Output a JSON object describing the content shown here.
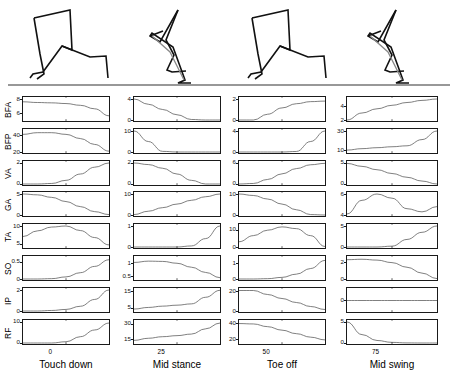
{
  "figure": {
    "title": "",
    "row_labels": [
      "BFA",
      "BFP",
      "VA",
      "GA",
      "TA",
      "SO",
      "IP",
      "RF"
    ],
    "column_labels": [
      "Touch down",
      "Mid stance",
      "Toe off",
      "Mid swing"
    ],
    "x_tick_labels": [
      "0",
      "25",
      "50",
      "75"
    ],
    "axis_color": "#1a1a1a",
    "curve_color": "#555555",
    "ground_color": "#333333"
  },
  "chart_data": {
    "type": "line",
    "xlabel": "Gait cycle (%)",
    "ylabel": "Muscle excitation",
    "grid": false,
    "legend": "none",
    "columns": [
      {
        "name": "Touch down",
        "x_tick": "0",
        "xlim": [
          0,
          25
        ]
      },
      {
        "name": "Mid stance",
        "x_tick": "25",
        "xlim": [
          25,
          50
        ]
      },
      {
        "name": "Toe off",
        "x_tick": "50",
        "xlim": [
          50,
          75
        ]
      },
      {
        "name": "Mid swing",
        "x_tick": "75",
        "xlim": [
          75,
          100
        ]
      }
    ],
    "rows": [
      {
        "name": "BFA",
        "cells": [
          {
            "column": "Touch down",
            "ylim": [
              5,
              8
            ],
            "yticks": [
              6,
              8
            ],
            "values": [
              7.6,
              7.5,
              7.45,
              7.35,
              7.1,
              6.6,
              5.6
            ]
          },
          {
            "column": "Mid stance",
            "ylim": [
              0,
              4
            ],
            "yticks": [
              0,
              4
            ],
            "values": [
              4.0,
              3.0,
              2.0,
              1.0,
              0.1,
              0.0,
              0.0
            ]
          },
          {
            "column": "Toe off",
            "ylim": [
              0,
              2
            ],
            "yticks": [
              0,
              2
            ],
            "values": [
              0.0,
              0.0,
              0.55,
              1.15,
              1.55,
              1.75,
              1.8
            ]
          },
          {
            "column": "Mid swing",
            "ylim": [
              2,
              5
            ],
            "yticks": [
              2,
              4
            ],
            "values": [
              2.0,
              3.0,
              3.6,
              4.1,
              4.5,
              4.8,
              5.0
            ]
          }
        ]
      },
      {
        "name": "BFP",
        "cells": [
          {
            "column": "Touch down",
            "ylim": [
              20,
              45
            ],
            "yticks": [
              20,
              40
            ],
            "values": [
              41,
              43,
              43,
              41,
              36,
              29,
              21
            ]
          },
          {
            "column": "Mid stance",
            "ylim": [
              0,
              10
            ],
            "yticks": [
              0,
              10
            ],
            "values": [
              10,
              5,
              0.3,
              0,
              0,
              0,
              0
            ]
          },
          {
            "column": "Toe off",
            "ylim": [
              0,
              4
            ],
            "yticks": [
              0,
              4
            ],
            "values": [
              0,
              0,
              0,
              0,
              0.1,
              2.0,
              4.0
            ]
          },
          {
            "column": "Mid swing",
            "ylim": [
              8,
              30
            ],
            "yticks": [
              10,
              30
            ],
            "values": [
              10,
              11.5,
              12.5,
              13.5,
              14.5,
              21,
              30
            ]
          }
        ]
      },
      {
        "name": "VA",
        "cells": [
          {
            "column": "Touch down",
            "ylim": [
              0,
              2
            ],
            "yticks": [
              0,
              2
            ],
            "values": [
              0,
              0,
              0.05,
              0.35,
              0.95,
              1.6,
              2.0
            ]
          },
          {
            "column": "Mid stance",
            "ylim": [
              0,
              2
            ],
            "yticks": [
              0,
              2
            ],
            "values": [
              2.0,
              1.85,
              1.5,
              0.95,
              0.35,
              0.0,
              0.0
            ]
          },
          {
            "column": "Toe off",
            "ylim": [
              0,
              6
            ],
            "yticks": [
              0,
              6
            ],
            "values": [
              0,
              0.15,
              1.3,
              2.9,
              4.4,
              5.5,
              5.9
            ]
          },
          {
            "column": "Mid swing",
            "ylim": [
              0,
              5
            ],
            "yticks": [
              0,
              5
            ],
            "values": [
              4.9,
              4.2,
              3.4,
              2.5,
              1.6,
              0.7,
              0.0
            ]
          }
        ]
      },
      {
        "name": "GA",
        "cells": [
          {
            "column": "Touch down",
            "ylim": [
              0,
              5
            ],
            "yticks": [
              0,
              5
            ],
            "values": [
              5.0,
              4.8,
              4.2,
              3.2,
              2.0,
              0.8,
              0.1
            ]
          },
          {
            "column": "Mid stance",
            "ylim": [
              0,
              10
            ],
            "yticks": [
              0,
              10
            ],
            "values": [
              0.2,
              1.8,
              3.5,
              5.2,
              7.0,
              8.7,
              10.0
            ]
          },
          {
            "column": "Toe off",
            "ylim": [
              0,
              10
            ],
            "yticks": [
              0,
              10
            ],
            "values": [
              10,
              9.3,
              7.6,
              5.2,
              2.5,
              0.2,
              0.0
            ]
          },
          {
            "column": "Mid swing",
            "ylim": [
              4,
              6
            ],
            "yticks": [
              4,
              6
            ],
            "values": [
              4.1,
              5.4,
              6.0,
              5.6,
              4.6,
              4.3,
              4.8
            ]
          }
        ]
      },
      {
        "name": "TA",
        "cells": [
          {
            "column": "Touch down",
            "ylim": [
              4,
              10
            ],
            "yticks": [
              5,
              10
            ],
            "values": [
              7.0,
              8.6,
              9.7,
              10.0,
              8.7,
              6.7,
              4.6
            ]
          },
          {
            "column": "Mid stance",
            "ylim": [
              0,
              1
            ],
            "yticks": [
              0,
              1
            ],
            "values": [
              0,
              0,
              0,
              0,
              0.05,
              0.4,
              1.0
            ]
          },
          {
            "column": "Toe off",
            "ylim": [
              0,
              12
            ],
            "yticks": [
              0,
              10
            ],
            "values": [
              3.0,
              6.5,
              9.6,
              11.5,
              10.5,
              6.5,
              0.3
            ]
          },
          {
            "column": "Mid swing",
            "ylim": [
              0,
              5
            ],
            "yticks": [
              0,
              5
            ],
            "values": [
              0,
              0,
              0,
              0.2,
              1.8,
              3.5,
              5.0
            ]
          }
        ]
      },
      {
        "name": "SO",
        "cells": [
          {
            "column": "Touch down",
            "ylim": [
              0,
              0.6
            ],
            "yticks": [
              0,
              0.5
            ],
            "values": [
              0,
              0,
              0.01,
              0.06,
              0.18,
              0.36,
              0.55
            ]
          },
          {
            "column": "Mid stance",
            "ylim": [
              0.4,
              1.2
            ],
            "yticks": [
              0.5,
              1
            ],
            "values": [
              1.03,
              1.08,
              1.07,
              1.0,
              0.85,
              0.65,
              0.45
            ]
          },
          {
            "column": "Toe off",
            "ylim": [
              0,
              1.3
            ],
            "yticks": [
              0,
              1
            ],
            "values": [
              0,
              0,
              0.02,
              0.1,
              0.3,
              0.65,
              1.15
            ]
          },
          {
            "column": "Mid swing",
            "ylim": [
              0,
              2.5
            ],
            "yticks": [
              0,
              2
            ],
            "values": [
              2.3,
              2.35,
              2.25,
              1.95,
              1.4,
              0.7,
              0.05
            ]
          }
        ]
      },
      {
        "name": "IP",
        "cells": [
          {
            "column": "Touch down",
            "ylim": [
              0,
              2
            ],
            "yticks": [
              0,
              2
            ],
            "values": [
              0,
              0,
              0.05,
              0.15,
              0.45,
              1.1,
              2.0
            ]
          },
          {
            "column": "Mid stance",
            "ylim": [
              3,
              16
            ],
            "yticks": [
              5,
              15
            ],
            "values": [
              4.2,
              5.2,
              6.0,
              6.6,
              7.4,
              11.5,
              15.8
            ]
          },
          {
            "column": "Toe off",
            "ylim": [
              0,
              21
            ],
            "yticks": [
              0,
              20
            ],
            "values": [
              20.5,
              20.5,
              16.5,
              12.5,
              8.5,
              4.5,
              1.5
            ]
          },
          {
            "column": "Mid swing",
            "ylim": [
              -1,
              1
            ],
            "yticks": [
              0
            ],
            "values": [
              0,
              0,
              0,
              0,
              0,
              0,
              0
            ]
          }
        ]
      },
      {
        "name": "RF",
        "cells": [
          {
            "column": "Touch down",
            "ylim": [
              0,
              10
            ],
            "yticks": [
              0,
              10
            ],
            "values": [
              0,
              0,
              0,
              0.6,
              3.0,
              6.2,
              9.5
            ]
          },
          {
            "column": "Mid stance",
            "ylim": [
              12,
              32
            ],
            "yticks": [
              15,
              30
            ],
            "values": [
              14.5,
              16.5,
              18.0,
              19.0,
              20.5,
              25.5,
              31.0
            ]
          },
          {
            "column": "Toe off",
            "ylim": [
              15,
              42
            ],
            "yticks": [
              20,
              40
            ],
            "values": [
              40.0,
              39.5,
              36.0,
              31.5,
              27.0,
              22.5,
              19.0
            ]
          },
          {
            "column": "Mid swing",
            "ylim": [
              0,
              5
            ],
            "yticks": [
              0,
              5
            ],
            "values": [
              5.0,
              2.0,
              0.6,
              0.15,
              0.02,
              0,
              0
            ]
          }
        ]
      }
    ]
  },
  "stick_figures": [
    {
      "name": "Touch down",
      "phase": "touch-down"
    },
    {
      "name": "Mid stance",
      "phase": "mid-stance"
    },
    {
      "name": "Toe off",
      "phase": "toe-off"
    },
    {
      "name": "Mid swing",
      "phase": "mid-swing"
    }
  ]
}
